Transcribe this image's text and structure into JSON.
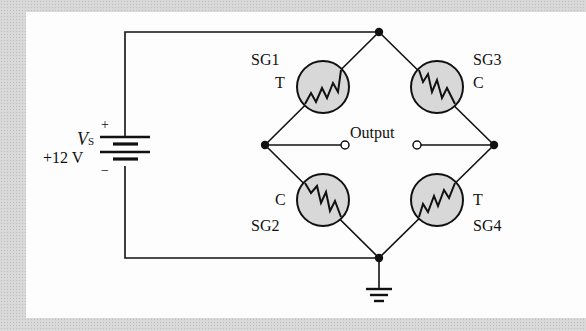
{
  "diagram": {
    "type": "wheatstone-bridge-strain-gauge-circuit",
    "source": {
      "symbol": "V",
      "subscript": "S",
      "value_label": "+12 V",
      "plus_label": "+",
      "minus_label": "−"
    },
    "gauges": [
      {
        "id": "SG1",
        "name": "SG1",
        "mode": "T",
        "position": "upper-left"
      },
      {
        "id": "SG3",
        "name": "SG3",
        "mode": "C",
        "position": "upper-right"
      },
      {
        "id": "SG2",
        "name": "SG2",
        "mode": "C",
        "position": "lower-left"
      },
      {
        "id": "SG4",
        "name": "SG4",
        "mode": "T",
        "position": "lower-right"
      }
    ],
    "output_label": "Output",
    "ground": "ground-symbol",
    "colors": {
      "line": "#111111",
      "gauge_fill": "#d8d8d8",
      "panel": "#fdfdfd"
    }
  }
}
